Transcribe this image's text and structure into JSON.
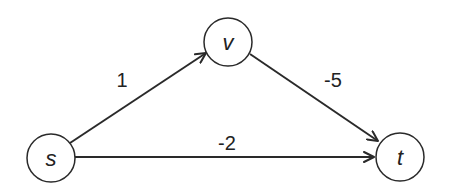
{
  "diagram": {
    "type": "directed-weighted-graph",
    "colors": {
      "stroke": "#2a2a2a",
      "node_fill": "#ffffff",
      "text": "#222222"
    },
    "nodes": [
      {
        "id": "s",
        "label": "s",
        "cx": 51,
        "cy": 158,
        "r": 24
      },
      {
        "id": "v",
        "label": "v",
        "cx": 228,
        "cy": 42,
        "r": 24
      },
      {
        "id": "t",
        "label": "t",
        "cx": 400,
        "cy": 157,
        "r": 24
      }
    ],
    "edges": [
      {
        "from": "s",
        "to": "v",
        "weight": "1",
        "label_x": 122,
        "label_y": 87
      },
      {
        "from": "v",
        "to": "t",
        "weight": "-5",
        "label_x": 333,
        "label_y": 87
      },
      {
        "from": "s",
        "to": "t",
        "weight": "-2",
        "label_x": 227,
        "label_y": 150
      }
    ]
  }
}
